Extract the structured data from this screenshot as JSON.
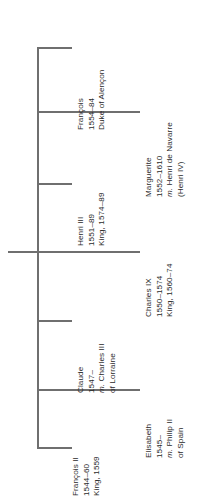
{
  "diagram": {
    "type": "family-tree",
    "orientation": "rotated-90-left",
    "line_color": "#6f6f6f",
    "text_color": "#2b2b2b",
    "background": "#ffffff"
  },
  "people": [
    {
      "id": "francois-dalencon",
      "name": "François",
      "lines": [
        "François",
        "1554–84",
        "Duke of Alençon"
      ],
      "dates": "1554–84",
      "note": "Duke of Alençon",
      "branch_length": "short"
    },
    {
      "id": "marguerite",
      "name": "Marguerite",
      "lines": [
        "Marguerite",
        "1552–1610",
        "m. Henri de Navarre",
        "(Henri IV)"
      ],
      "dates": "1552–1610",
      "marriage": "m. Henri de Navarre",
      "note": "(Henri IV)",
      "branch_length": "long"
    },
    {
      "id": "henri-iii",
      "name": "Henri III",
      "lines": [
        "Henri III",
        "1551–89",
        "King, 1574–89"
      ],
      "dates": "1551–89",
      "reign": "King, 1574–89",
      "branch_length": "short"
    },
    {
      "id": "charles-ix",
      "name": "Charles IX",
      "lines": [
        "Charles IX",
        "1550–1574",
        "King, 1560–74"
      ],
      "dates": "1550–1574",
      "reign": "King, 1560–74",
      "branch_length": "long"
    },
    {
      "id": "claude",
      "name": "Claude",
      "lines": [
        "Claude",
        "1547–",
        "m. Charles III",
        "of Lorraine"
      ],
      "dates": "1547–",
      "marriage": "m. Charles III",
      "note": "of Lorraine",
      "branch_length": "short"
    },
    {
      "id": "elisabeth",
      "name": "Elisabeth",
      "lines": [
        "Elisabeth",
        "1545–",
        "m. Philip II",
        "of Spain"
      ],
      "dates": "1545–",
      "marriage": "m. Philip II",
      "note": "of Spain",
      "branch_length": "long"
    },
    {
      "id": "francois-ii",
      "name": "François II",
      "lines": [
        "François II",
        "1544–60",
        "King, 1559"
      ],
      "dates": "1544–60",
      "reign": "King, 1559",
      "branch_length": "short"
    }
  ],
  "labels": {
    "p0_l0": "François",
    "p0_l1": "1554–84",
    "p0_l2": "Duke of Alençon",
    "p1_l0": "Marguerite",
    "p1_l1": "1552–1610",
    "p1_l2a": "m.",
    "p1_l2b": " Henri de Navarre",
    "p1_l3": "(Henri IV)",
    "p2_l0": "Henri III",
    "p2_l1": "1551–89",
    "p2_l2": "King, 1574–89",
    "p3_l0": "Charles IX",
    "p3_l1": "1550–1574",
    "p3_l2": "King, 1560–74",
    "p4_l0": "Claude",
    "p4_l1": "1547–",
    "p4_l2a": "m.",
    "p4_l2b": " Charles III",
    "p4_l3": "of Lorraine",
    "p5_l0": "Elisabeth",
    "p5_l1": "1545–",
    "p5_l2a": "m.",
    "p5_l2b": " Philip II",
    "p5_l3": "of Spain",
    "p6_l0": "François II",
    "p6_l1": "1544–60",
    "p6_l2": "King, 1559"
  }
}
